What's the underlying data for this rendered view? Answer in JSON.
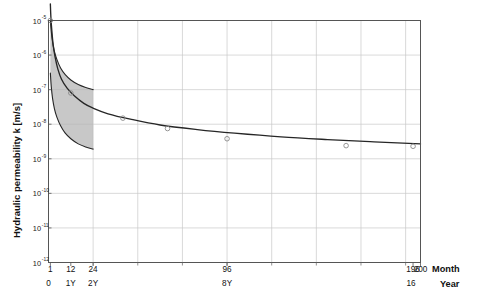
{
  "chart_data": {
    "type": "line",
    "title": "",
    "subtitle": "",
    "xlabel": "Month",
    "xlabel_secondary": "Year",
    "ylabel": "Hydraulic permeability k [m/s]",
    "xlim": [
      0,
      200
    ],
    "ylim_exponents": [
      -12,
      -5
    ],
    "y_scale": "log",
    "x_scale": "linear",
    "grid": true,
    "legend": "none",
    "y_ticks": [
      {
        "label": "10",
        "exponent": "-5",
        "value": 1e-05
      },
      {
        "label": "10",
        "exponent": "-6",
        "value": 1e-06
      },
      {
        "label": "10",
        "exponent": "-7",
        "value": 1e-07
      },
      {
        "label": "10",
        "exponent": "-8",
        "value": 1e-08
      },
      {
        "label": "10",
        "exponent": "-9",
        "value": 1e-09
      },
      {
        "label": "10",
        "exponent": "-10",
        "value": 1e-10
      },
      {
        "label": "10",
        "exponent": "-11",
        "value": 1e-11
      },
      {
        "label": "10",
        "exponent": "-12",
        "value": 1e-12
      }
    ],
    "x_ticks_month": [
      {
        "label": "1",
        "value": 1
      },
      {
        "label": "12",
        "value": 12
      },
      {
        "label": "24",
        "value": 24
      },
      {
        "label": "96",
        "value": 96
      },
      {
        "label": "196",
        "value": 196
      },
      {
        "label": "200",
        "value": 200
      }
    ],
    "x_ticks_year": [
      {
        "label": "0",
        "value": 0
      },
      {
        "label": "1Y",
        "value": 12
      },
      {
        "label": "2Y",
        "value": 24
      },
      {
        "label": "8Y",
        "value": 96
      },
      {
        "label": "16",
        "value": 196
      }
    ],
    "series": [
      {
        "name": "best-fit curve",
        "kind": "line",
        "color": "#262626",
        "points": [
          {
            "x": 1.0,
            "y": 3e-05
          },
          {
            "x": 1.3,
            "y": 1.2e-05
          },
          {
            "x": 1.8,
            "y": 5e-06
          },
          {
            "x": 2.5,
            "y": 2e-06
          },
          {
            "x": 3.5,
            "y": 9e-07
          },
          {
            "x": 5.0,
            "y": 4e-07
          },
          {
            "x": 7.0,
            "y": 2e-07
          },
          {
            "x": 10.0,
            "y": 1.1e-07
          },
          {
            "x": 14.0,
            "y": 6.5e-08
          },
          {
            "x": 19.0,
            "y": 4e-08
          },
          {
            "x": 24.0,
            "y": 2.9e-08
          },
          {
            "x": 32.0,
            "y": 2e-08
          },
          {
            "x": 44.0,
            "y": 1.4e-08
          },
          {
            "x": 60.0,
            "y": 9.5e-09
          },
          {
            "x": 80.0,
            "y": 7e-09
          },
          {
            "x": 100.0,
            "y": 5.5e-09
          },
          {
            "x": 125.0,
            "y": 4.3e-09
          },
          {
            "x": 150.0,
            "y": 3.6e-09
          },
          {
            "x": 175.0,
            "y": 3.1e-09
          },
          {
            "x": 200.0,
            "y": 2.7e-09
          }
        ]
      },
      {
        "name": "upper bound",
        "kind": "band-edge",
        "color": "#262626",
        "points": [
          {
            "x": 1.0,
            "y": 1e-05
          },
          {
            "x": 1.4,
            "y": 5.5e-06
          },
          {
            "x": 2.0,
            "y": 2.8e-06
          },
          {
            "x": 3.0,
            "y": 1.4e-06
          },
          {
            "x": 4.5,
            "y": 7.5e-07
          },
          {
            "x": 6.5,
            "y": 4.2e-07
          },
          {
            "x": 9.0,
            "y": 2.7e-07
          },
          {
            "x": 12.0,
            "y": 1.9e-07
          },
          {
            "x": 16.0,
            "y": 1.4e-07
          },
          {
            "x": 20.0,
            "y": 1.15e-07
          },
          {
            "x": 24.0,
            "y": 1e-07
          }
        ]
      },
      {
        "name": "lower bound",
        "kind": "band-edge",
        "color": "#262626",
        "points": [
          {
            "x": 1.0,
            "y": 3e-07
          },
          {
            "x": 1.5,
            "y": 1.2e-07
          },
          {
            "x": 2.2,
            "y": 5.5e-08
          },
          {
            "x": 3.2,
            "y": 2.8e-08
          },
          {
            "x": 4.5,
            "y": 1.6e-08
          },
          {
            "x": 6.5,
            "y": 9e-09
          },
          {
            "x": 9.0,
            "y": 5.5e-09
          },
          {
            "x": 12.0,
            "y": 3.8e-09
          },
          {
            "x": 16.0,
            "y": 2.7e-09
          },
          {
            "x": 20.0,
            "y": 2.2e-09
          },
          {
            "x": 24.0,
            "y": 1.9e-09
          }
        ]
      },
      {
        "name": "measurements",
        "kind": "scatter",
        "marker": "open-circle",
        "color": "#8a8a8a",
        "points": [
          {
            "x": 1,
            "y": 1e-05
          },
          {
            "x": 12,
            "y": 8e-08
          },
          {
            "x": 40,
            "y": 1.5e-08
          },
          {
            "x": 64,
            "y": 7.5e-09
          },
          {
            "x": 96,
            "y": 3.8e-09
          },
          {
            "x": 160,
            "y": 2.4e-09
          },
          {
            "x": 196,
            "y": 2.3e-09
          }
        ]
      }
    ],
    "band": {
      "name": "uncertainty band",
      "fill_color": "#b3b3b3",
      "x_start": 1,
      "x_end": 24
    }
  },
  "axis_titles": {
    "month": "Month",
    "year": "Year"
  }
}
